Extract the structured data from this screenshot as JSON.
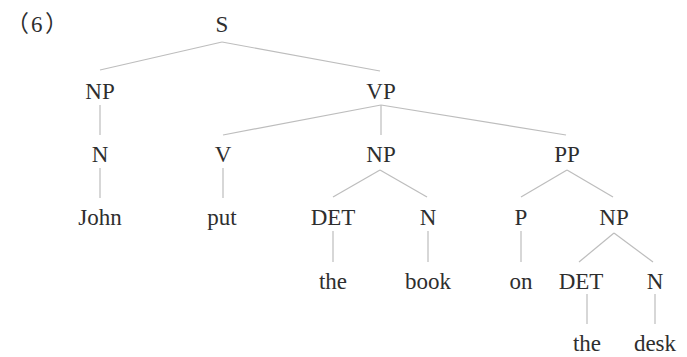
{
  "example_label": "（6）",
  "colors": {
    "text": "#2e2e2e",
    "edge": "#bdbdbd"
  },
  "tree": {
    "nodes": [
      {
        "id": "S",
        "label": "S",
        "x": 222,
        "y": 13
      },
      {
        "id": "NP1",
        "label": "NP",
        "x": 100,
        "y": 80
      },
      {
        "id": "VP",
        "label": "VP",
        "x": 381,
        "y": 80
      },
      {
        "id": "N1",
        "label": "N",
        "x": 100,
        "y": 143
      },
      {
        "id": "V",
        "label": "V",
        "x": 223,
        "y": 143
      },
      {
        "id": "NP2",
        "label": "NP",
        "x": 381,
        "y": 143
      },
      {
        "id": "PP",
        "label": "PP",
        "x": 567,
        "y": 143
      },
      {
        "id": "John",
        "label": "John",
        "x": 100,
        "y": 206
      },
      {
        "id": "put",
        "label": "put",
        "x": 222,
        "y": 206
      },
      {
        "id": "DET1",
        "label": "DET",
        "x": 333,
        "y": 206
      },
      {
        "id": "N2",
        "label": "N",
        "x": 428,
        "y": 206
      },
      {
        "id": "P",
        "label": "P",
        "x": 521,
        "y": 206
      },
      {
        "id": "NP3",
        "label": "NP",
        "x": 614,
        "y": 206
      },
      {
        "id": "the1",
        "label": "the",
        "x": 333,
        "y": 270
      },
      {
        "id": "book",
        "label": "book",
        "x": 428,
        "y": 270
      },
      {
        "id": "on",
        "label": "on",
        "x": 521,
        "y": 270
      },
      {
        "id": "DET2",
        "label": "DET",
        "x": 581,
        "y": 270
      },
      {
        "id": "N3",
        "label": "N",
        "x": 655,
        "y": 270
      },
      {
        "id": "the2",
        "label": "the",
        "x": 587,
        "y": 332
      },
      {
        "id": "desk",
        "label": "desk",
        "x": 655,
        "y": 332
      }
    ],
    "edges": [
      {
        "from": "S",
        "to": "NP1",
        "x1": 222,
        "y1": 42,
        "x2": 100,
        "y2": 70
      },
      {
        "from": "S",
        "to": "VP",
        "x1": 222,
        "y1": 42,
        "x2": 380,
        "y2": 71
      },
      {
        "from": "NP1",
        "to": "N1",
        "x1": 100,
        "y1": 105,
        "x2": 100,
        "y2": 135
      },
      {
        "from": "VP",
        "to": "V",
        "x1": 381,
        "y1": 105,
        "x2": 223,
        "y2": 135
      },
      {
        "from": "VP",
        "to": "NP2",
        "x1": 381,
        "y1": 105,
        "x2": 381,
        "y2": 135
      },
      {
        "from": "VP",
        "to": "PP",
        "x1": 381,
        "y1": 105,
        "x2": 566,
        "y2": 135
      },
      {
        "from": "N1",
        "to": "John",
        "x1": 100,
        "y1": 168,
        "x2": 100,
        "y2": 198
      },
      {
        "from": "V",
        "to": "put",
        "x1": 223,
        "y1": 168,
        "x2": 223,
        "y2": 198
      },
      {
        "from": "NP2",
        "to": "DET1",
        "x1": 380,
        "y1": 170,
        "x2": 333,
        "y2": 197
      },
      {
        "from": "NP2",
        "to": "N2",
        "x1": 380,
        "y1": 170,
        "x2": 427,
        "y2": 197
      },
      {
        "from": "PP",
        "to": "P",
        "x1": 567,
        "y1": 170,
        "x2": 521,
        "y2": 197
      },
      {
        "from": "PP",
        "to": "NP3",
        "x1": 567,
        "y1": 170,
        "x2": 613,
        "y2": 197
      },
      {
        "from": "DET1",
        "to": "the1",
        "x1": 333,
        "y1": 231,
        "x2": 333,
        "y2": 262
      },
      {
        "from": "N2",
        "to": "book",
        "x1": 428,
        "y1": 231,
        "x2": 428,
        "y2": 262
      },
      {
        "from": "P",
        "to": "on",
        "x1": 521,
        "y1": 231,
        "x2": 521,
        "y2": 262
      },
      {
        "from": "NP3",
        "to": "DET2",
        "x1": 614,
        "y1": 233,
        "x2": 579,
        "y2": 262
      },
      {
        "from": "NP3",
        "to": "N3",
        "x1": 614,
        "y1": 233,
        "x2": 653,
        "y2": 262
      },
      {
        "from": "DET2",
        "to": "the2",
        "x1": 587,
        "y1": 294,
        "x2": 587,
        "y2": 324
      },
      {
        "from": "N3",
        "to": "desk",
        "x1": 655,
        "y1": 294,
        "x2": 655,
        "y2": 324
      }
    ]
  }
}
